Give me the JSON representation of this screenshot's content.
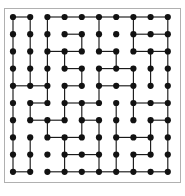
{
  "figure": {
    "caption_label": "6.",
    "title": "",
    "type": "grid-lattice-maze"
  },
  "frame": {
    "border_color": "#b0b0b0",
    "background_color": "#ffffff",
    "x": 4,
    "y": 8,
    "width": 177,
    "height": 175
  },
  "lattice": {
    "rows": 10,
    "cols": 10,
    "node_color": "#121212",
    "node_radius": 3.1,
    "edge_color": "#1a1a1a",
    "edge_width": 1.15,
    "origin_x": 13,
    "origin_y": 17,
    "spacing_x": 17.2,
    "spacing_y": 17.2,
    "node_count": 100
  },
  "chart_data": {
    "type": "scatter",
    "title": "",
    "subtitle": "",
    "xlabel": "",
    "ylabel": "",
    "grid": false,
    "legend": [],
    "xlim": [
      0,
      9
    ],
    "ylim": [
      0,
      9
    ],
    "xticks": [
      0,
      1,
      2,
      3,
      4,
      5,
      6,
      7,
      8,
      9
    ],
    "yticks": [
      0,
      1,
      2,
      3,
      4,
      5,
      6,
      7,
      8,
      9
    ],
    "nodes": [
      [
        0,
        0
      ],
      [
        1,
        0
      ],
      [
        2,
        0
      ],
      [
        3,
        0
      ],
      [
        4,
        0
      ],
      [
        5,
        0
      ],
      [
        6,
        0
      ],
      [
        7,
        0
      ],
      [
        8,
        0
      ],
      [
        9,
        0
      ],
      [
        0,
        1
      ],
      [
        1,
        1
      ],
      [
        2,
        1
      ],
      [
        3,
        1
      ],
      [
        4,
        1
      ],
      [
        5,
        1
      ],
      [
        6,
        1
      ],
      [
        7,
        1
      ],
      [
        8,
        1
      ],
      [
        9,
        1
      ],
      [
        0,
        2
      ],
      [
        1,
        2
      ],
      [
        2,
        2
      ],
      [
        3,
        2
      ],
      [
        4,
        2
      ],
      [
        5,
        2
      ],
      [
        6,
        2
      ],
      [
        7,
        2
      ],
      [
        8,
        2
      ],
      [
        9,
        2
      ],
      [
        0,
        3
      ],
      [
        1,
        3
      ],
      [
        2,
        3
      ],
      [
        3,
        3
      ],
      [
        4,
        3
      ],
      [
        5,
        3
      ],
      [
        6,
        3
      ],
      [
        7,
        3
      ],
      [
        8,
        3
      ],
      [
        9,
        3
      ],
      [
        0,
        4
      ],
      [
        1,
        4
      ],
      [
        2,
        4
      ],
      [
        3,
        4
      ],
      [
        4,
        4
      ],
      [
        5,
        4
      ],
      [
        6,
        4
      ],
      [
        7,
        4
      ],
      [
        8,
        4
      ],
      [
        9,
        4
      ],
      [
        0,
        5
      ],
      [
        1,
        5
      ],
      [
        2,
        5
      ],
      [
        3,
        5
      ],
      [
        4,
        5
      ],
      [
        5,
        5
      ],
      [
        6,
        5
      ],
      [
        7,
        5
      ],
      [
        8,
        5
      ],
      [
        9,
        5
      ],
      [
        0,
        6
      ],
      [
        1,
        6
      ],
      [
        2,
        6
      ],
      [
        3,
        6
      ],
      [
        4,
        6
      ],
      [
        5,
        6
      ],
      [
        6,
        6
      ],
      [
        7,
        6
      ],
      [
        8,
        6
      ],
      [
        9,
        6
      ],
      [
        0,
        7
      ],
      [
        1,
        7
      ],
      [
        2,
        7
      ],
      [
        3,
        7
      ],
      [
        4,
        7
      ],
      [
        5,
        7
      ],
      [
        6,
        7
      ],
      [
        7,
        7
      ],
      [
        8,
        7
      ],
      [
        9,
        7
      ],
      [
        0,
        8
      ],
      [
        1,
        8
      ],
      [
        2,
        8
      ],
      [
        3,
        8
      ],
      [
        4,
        8
      ],
      [
        5,
        8
      ],
      [
        6,
        8
      ],
      [
        7,
        8
      ],
      [
        8,
        8
      ],
      [
        9,
        8
      ],
      [
        0,
        9
      ],
      [
        1,
        9
      ],
      [
        2,
        9
      ],
      [
        3,
        9
      ],
      [
        4,
        9
      ],
      [
        5,
        9
      ],
      [
        6,
        9
      ],
      [
        7,
        9
      ],
      [
        8,
        9
      ],
      [
        9,
        9
      ]
    ],
    "edges": [
      [
        0,
        0,
        1,
        0
      ],
      [
        2,
        0,
        3,
        0
      ],
      [
        3,
        0,
        4,
        0
      ],
      [
        4,
        0,
        5,
        0
      ],
      [
        5,
        0,
        6,
        0
      ],
      [
        6,
        0,
        7,
        0
      ],
      [
        7,
        0,
        8,
        0
      ],
      [
        8,
        0,
        9,
        0
      ],
      [
        0,
        0,
        0,
        1
      ],
      [
        1,
        0,
        1,
        1
      ],
      [
        2,
        0,
        2,
        1
      ],
      [
        5,
        0,
        5,
        1
      ],
      [
        7,
        0,
        7,
        1
      ],
      [
        9,
        0,
        9,
        1
      ],
      [
        3,
        1,
        4,
        1
      ],
      [
        7,
        1,
        8,
        1
      ],
      [
        8,
        1,
        9,
        1
      ],
      [
        0,
        1,
        0,
        2
      ],
      [
        1,
        1,
        1,
        2
      ],
      [
        2,
        1,
        2,
        2
      ],
      [
        4,
        1,
        4,
        2
      ],
      [
        5,
        1,
        5,
        2
      ],
      [
        7,
        1,
        7,
        2
      ],
      [
        9,
        1,
        9,
        2
      ],
      [
        2,
        2,
        3,
        2
      ],
      [
        3,
        2,
        4,
        2
      ],
      [
        5,
        2,
        6,
        2
      ],
      [
        7,
        2,
        8,
        2
      ],
      [
        8,
        2,
        9,
        2
      ],
      [
        0,
        2,
        0,
        3
      ],
      [
        1,
        2,
        1,
        3
      ],
      [
        2,
        2,
        2,
        3
      ],
      [
        3,
        2,
        3,
        3
      ],
      [
        6,
        2,
        6,
        3
      ],
      [
        8,
        2,
        8,
        3
      ],
      [
        9,
        2,
        9,
        3
      ],
      [
        3,
        3,
        4,
        3
      ],
      [
        5,
        3,
        6,
        3
      ],
      [
        6,
        3,
        7,
        3
      ],
      [
        0,
        3,
        0,
        4
      ],
      [
        1,
        3,
        1,
        4
      ],
      [
        2,
        3,
        2,
        4
      ],
      [
        4,
        3,
        4,
        4
      ],
      [
        5,
        3,
        5,
        4
      ],
      [
        7,
        3,
        7,
        4
      ],
      [
        8,
        3,
        8,
        4
      ],
      [
        9,
        3,
        9,
        4
      ],
      [
        0,
        4,
        1,
        4
      ],
      [
        1,
        4,
        2,
        4
      ],
      [
        3,
        4,
        4,
        4
      ],
      [
        5,
        4,
        6,
        4
      ],
      [
        6,
        4,
        7,
        4
      ],
      [
        0,
        4,
        0,
        5
      ],
      [
        2,
        4,
        2,
        5
      ],
      [
        3,
        4,
        3,
        5
      ],
      [
        5,
        4,
        5,
        5
      ],
      [
        7,
        4,
        7,
        5
      ],
      [
        9,
        4,
        9,
        5
      ],
      [
        1,
        5,
        2,
        5
      ],
      [
        3,
        5,
        4,
        5
      ],
      [
        4,
        5,
        5,
        5
      ],
      [
        7,
        5,
        8,
        5
      ],
      [
        8,
        5,
        9,
        5
      ],
      [
        0,
        5,
        0,
        6
      ],
      [
        1,
        5,
        1,
        6
      ],
      [
        3,
        5,
        3,
        6
      ],
      [
        4,
        5,
        4,
        6
      ],
      [
        6,
        5,
        6,
        6
      ],
      [
        7,
        5,
        7,
        6
      ],
      [
        9,
        5,
        9,
        6
      ],
      [
        1,
        6,
        2,
        6
      ],
      [
        2,
        6,
        3,
        6
      ],
      [
        4,
        6,
        5,
        6
      ],
      [
        8,
        6,
        9,
        6
      ],
      [
        0,
        6,
        0,
        7
      ],
      [
        2,
        6,
        2,
        7
      ],
      [
        4,
        6,
        4,
        7
      ],
      [
        5,
        6,
        5,
        7
      ],
      [
        6,
        6,
        6,
        7
      ],
      [
        8,
        6,
        8,
        7
      ],
      [
        9,
        6,
        9,
        7
      ],
      [
        2,
        7,
        3,
        7
      ],
      [
        3,
        7,
        4,
        7
      ],
      [
        6,
        7,
        7,
        7
      ],
      [
        7,
        7,
        8,
        7
      ],
      [
        0,
        7,
        0,
        8
      ],
      [
        1,
        7,
        1,
        8
      ],
      [
        3,
        7,
        3,
        8
      ],
      [
        5,
        7,
        5,
        8
      ],
      [
        6,
        7,
        6,
        8
      ],
      [
        8,
        7,
        8,
        8
      ],
      [
        9,
        7,
        9,
        8
      ],
      [
        3,
        8,
        4,
        8
      ],
      [
        4,
        8,
        5,
        8
      ],
      [
        7,
        8,
        8,
        8
      ],
      [
        0,
        8,
        0,
        9
      ],
      [
        1,
        8,
        1,
        9
      ],
      [
        3,
        8,
        3,
        9
      ],
      [
        5,
        8,
        5,
        9
      ],
      [
        6,
        8,
        6,
        9
      ],
      [
        7,
        8,
        7,
        9
      ],
      [
        9,
        8,
        9,
        9
      ],
      [
        0,
        9,
        1,
        9
      ],
      [
        2,
        9,
        3,
        9
      ],
      [
        3,
        9,
        4,
        9
      ],
      [
        4,
        9,
        5,
        9
      ],
      [
        5,
        9,
        6,
        9
      ],
      [
        6,
        9,
        7,
        9
      ],
      [
        7,
        9,
        8,
        9
      ],
      [
        8,
        9,
        9,
        9
      ]
    ]
  }
}
